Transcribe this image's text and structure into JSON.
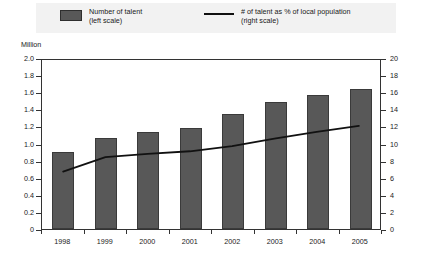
{
  "legend": {
    "bars": {
      "line1": "Number of talent",
      "line2": "(left scale)",
      "swatch_color": "#585858"
    },
    "line": {
      "line1": "# of talent as % of local population",
      "line2": "(right scale)",
      "swatch_color": "#111111"
    }
  },
  "axes": {
    "left_unit": "Million",
    "left_ticks": [
      "2.0",
      "1.8",
      "1.6",
      "1.4",
      "1.2",
      "1.0",
      "0.8",
      "0.6",
      "0.4",
      "0.2",
      "0"
    ],
    "right_ticks": [
      "20",
      "18",
      "16",
      "14",
      "12",
      "10",
      "8",
      "6",
      "4",
      "2",
      "0"
    ]
  },
  "chart_data": {
    "type": "bar",
    "title": "",
    "subtitle": "",
    "xlabel": "",
    "ylabel": "Million",
    "y2label": "",
    "categories": [
      "1998",
      "1999",
      "2000",
      "2001",
      "2002",
      "2003",
      "2004",
      "2005"
    ],
    "ylim": [
      0,
      2.0
    ],
    "y2lim": [
      0,
      20
    ],
    "grid": false,
    "legend_position": "top",
    "series": [
      {
        "name": "Number of talent (left scale)",
        "type": "bar",
        "axis": "left",
        "color": "#585858",
        "values": [
          0.9,
          1.07,
          1.13,
          1.18,
          1.35,
          1.49,
          1.57,
          1.64
        ]
      },
      {
        "name": "# of talent as % of local population (right scale)",
        "type": "line",
        "axis": "right",
        "color": "#111111",
        "values": [
          6.8,
          8.5,
          8.9,
          9.2,
          9.8,
          10.7,
          11.5,
          12.2
        ]
      }
    ]
  }
}
